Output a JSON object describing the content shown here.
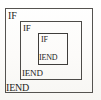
{
  "figure": {
    "type": "nested-block-diagram",
    "background_color": "#fdfdfc",
    "border_color": "#4a4a4a",
    "text_color": "#262523"
  },
  "blocks": [
    {
      "level": 1,
      "name": "outer",
      "open_label": "IF",
      "close_label": "IEND",
      "box": {
        "x": 5,
        "y": 8,
        "width": 88,
        "height": 85
      }
    },
    {
      "level": 2,
      "name": "middle",
      "open_label": "IF",
      "close_label": "IEND",
      "box": {
        "x": 20,
        "y": 21,
        "width": 62,
        "height": 59
      }
    },
    {
      "level": 3,
      "name": "inner",
      "open_label": "IF",
      "close_label": "IEND",
      "box": {
        "x": 38,
        "y": 33,
        "width": 30,
        "height": 32
      }
    }
  ]
}
